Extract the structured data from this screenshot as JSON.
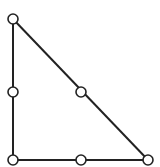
{
  "diagram": {
    "type": "triangle-mesh",
    "stroke_color": "#222222",
    "node_fill": "#ffffff",
    "nodes": [
      {
        "id": "n1",
        "x": 13,
        "y": 19
      },
      {
        "id": "n2",
        "x": 13,
        "y": 92
      },
      {
        "id": "n3",
        "x": 81,
        "y": 92
      },
      {
        "id": "n4",
        "x": 13,
        "y": 160
      },
      {
        "id": "n5",
        "x": 81,
        "y": 160
      },
      {
        "id": "n6",
        "x": 148,
        "y": 160
      }
    ],
    "edges": [
      [
        "n1",
        "n4"
      ],
      [
        "n4",
        "n6"
      ],
      [
        "n1",
        "n6"
      ]
    ]
  }
}
